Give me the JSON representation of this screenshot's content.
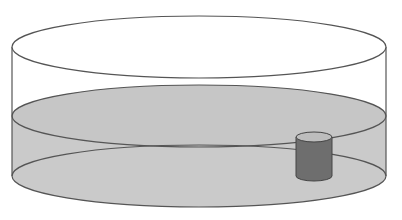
{
  "diagram": {
    "title": "",
    "colors": {
      "background": "#ffffff",
      "outline": "#555555",
      "liquid": "#c8c8c8",
      "liquid_bottom": "#cfcfcf",
      "small_cylinder_body": "#6e6e6e",
      "small_cylinder_top": "#bdbdbd"
    },
    "container": {
      "center_x": 199,
      "radius_x": 187,
      "radius_y": 31,
      "rim_center_y": 47,
      "liquid_surface_center_y": 116,
      "base_center_y": 176
    },
    "object": {
      "label": "",
      "center_x": 314,
      "radius_x": 18,
      "radius_y": 5,
      "top_center_y": 137,
      "bottom_center_y": 176
    }
  }
}
